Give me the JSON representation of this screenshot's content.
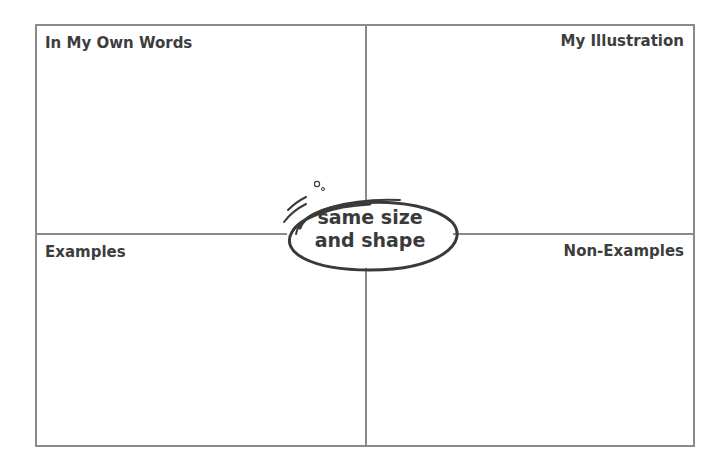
{
  "diagram": {
    "type": "four-square vocabulary organizer",
    "center_term": {
      "line1": "same size",
      "line2": "and shape"
    },
    "quadrants": {
      "top_left": "In My Own Words",
      "top_right": "My Illustration",
      "bottom_left": "Examples",
      "bottom_right": "Non-Examples"
    },
    "colors": {
      "border": "#8a8a8a",
      "text": "#3d3d3d",
      "oval_stroke": "#3a3a3a",
      "background": "#ffffff"
    }
  }
}
